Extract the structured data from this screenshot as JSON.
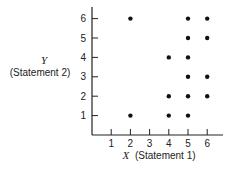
{
  "chart_data": {
    "type": "scatter",
    "title": "",
    "xlabel": "X (Statement 1)",
    "ylabel": "Y (Statement 2)",
    "x_var": "X",
    "x_desc": "(Statement 1)",
    "y_var": "Y",
    "y_desc": "(Statement 2)",
    "x_ticks": [
      "1",
      "2",
      "3",
      "4",
      "5",
      "6"
    ],
    "y_ticks": [
      "1",
      "2",
      "3",
      "4",
      "5",
      "6"
    ],
    "xlim": [
      0,
      7
    ],
    "ylim": [
      0,
      6.6
    ],
    "grid": false,
    "legend": null,
    "points": [
      {
        "x": 2,
        "y": 6
      },
      {
        "x": 5,
        "y": 6
      },
      {
        "x": 6,
        "y": 6
      },
      {
        "x": 5,
        "y": 5
      },
      {
        "x": 6,
        "y": 5
      },
      {
        "x": 4,
        "y": 4
      },
      {
        "x": 5,
        "y": 4
      },
      {
        "x": 5,
        "y": 3
      },
      {
        "x": 6,
        "y": 3
      },
      {
        "x": 4,
        "y": 2
      },
      {
        "x": 5,
        "y": 2
      },
      {
        "x": 6,
        "y": 2
      },
      {
        "x": 2,
        "y": 1
      },
      {
        "x": 4,
        "y": 1
      },
      {
        "x": 5,
        "y": 1
      }
    ]
  }
}
